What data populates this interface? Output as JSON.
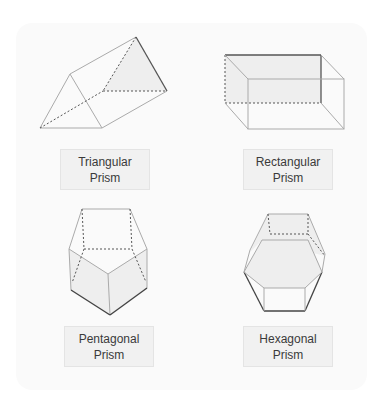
{
  "diagram": {
    "shapes": [
      {
        "id": "triangular",
        "label_line1": "Triangular",
        "label_line2": "Prism"
      },
      {
        "id": "rectangular",
        "label_line1": "Rectangular",
        "label_line2": "Prism"
      },
      {
        "id": "pentagonal",
        "label_line1": "Pentagonal",
        "label_line2": "Prism"
      },
      {
        "id": "hexagonal",
        "label_line1": "Hexagonal",
        "label_line2": "Prism"
      }
    ],
    "colors": {
      "edge": "#9a9a9a",
      "hidden_edge": "#555555",
      "bold_edge": "#444444",
      "face_fill": "#eeeeee",
      "label_bg": "#f1f1f1",
      "card_bg": "#fafafa"
    }
  }
}
